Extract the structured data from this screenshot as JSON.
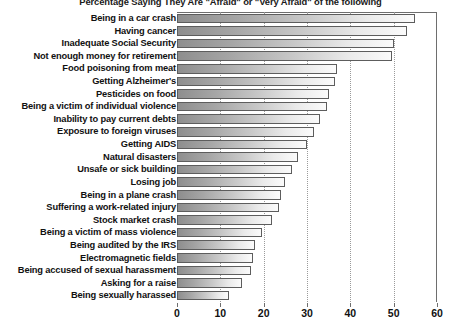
{
  "chart_data": {
    "type": "bar",
    "orientation": "horizontal",
    "title": "Percentage Saying They Are \"Afraid\" or \"Very Afraid\" of the following",
    "xlabel": "",
    "ylabel": "",
    "xlim": [
      0,
      60
    ],
    "xticks": [
      0,
      10,
      20,
      30,
      40,
      50,
      60
    ],
    "xtick_labels": [
      "0",
      "10",
      "20",
      "30",
      "40",
      "50",
      "60"
    ],
    "grid": true,
    "grid_axis": "x",
    "grid_style": "dotted",
    "legend": false,
    "categories": [
      "Being in a car crash",
      "Having cancer",
      "Inadequate Social Security",
      "Not enough money for retirement",
      "Food poisoning from meat",
      "Getting Alzheimer's",
      "Pesticides on food",
      "Being a victim of individual violence",
      "Inability to pay current debts",
      "Exposure to foreign viruses",
      "Getting AIDS",
      "Natural disasters",
      "Unsafe or sick building",
      "Losing job",
      "Being in a plane crash",
      "Suffering a work-related injury",
      "Stock market crash",
      "Being a victim of mass violence",
      "Being audited by the IRS",
      "Electromagnetic fields",
      "Being accused of sexual harassment",
      "Asking for a raise",
      "Being sexually harassed"
    ],
    "values": [
      55,
      53,
      50,
      49.5,
      37,
      36.5,
      35,
      34.5,
      33,
      31.5,
      30,
      28,
      26.5,
      25,
      24,
      23.5,
      22,
      19.5,
      18,
      17.5,
      17,
      15,
      12
    ],
    "colors": {
      "bar_fill_start": "#8e8e8e",
      "bar_fill_end": "#fbfbfb",
      "bar_border": "#5d5d5d",
      "gridline": "#9a9a9a",
      "axis": "#6e6e6e",
      "text": "#111111",
      "background": "#ffffff"
    }
  }
}
